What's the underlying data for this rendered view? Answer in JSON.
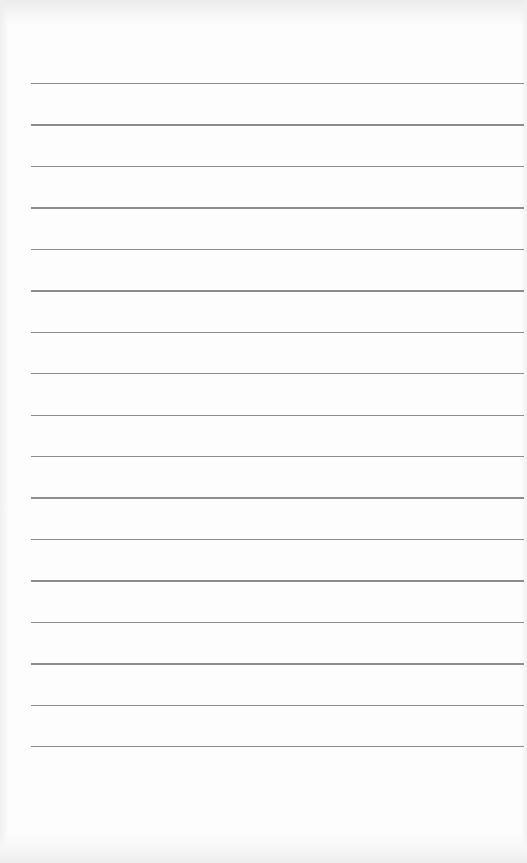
{
  "page": {
    "type": "lined-paper",
    "background_color": "#fdfdfd",
    "text": ""
  },
  "rules": {
    "count": 17,
    "color": "#8c8c8c",
    "first_y": 83,
    "spacing": 41.44,
    "left_x": 31,
    "right_x": 524
  }
}
